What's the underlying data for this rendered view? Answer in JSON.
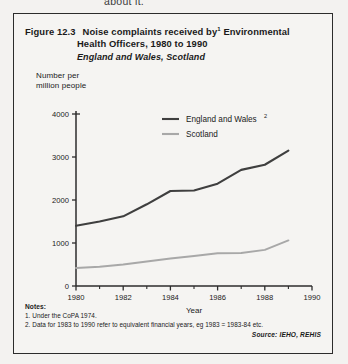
{
  "page_bleed_text": "about it.",
  "figure": {
    "number_label": "Figure 12.3",
    "title_line1": "Noise complaints received by",
    "title_line1_cont": "Environmental",
    "title_superscript": "1",
    "title_line2": "Health Officers, 1980 to 1990",
    "subtitle": "England and Wales, Scotland"
  },
  "notes": {
    "heading": "Notes:",
    "items": [
      "1. Under the CoPA 1974.",
      "2. Data for 1983 to 1990 refer to equivalent financial years, eg 1983 = 1983-84 etc."
    ],
    "source": "Source:  IEHO, REHIS"
  },
  "colors": {
    "england_wales": "#3f3f3f",
    "scotland": "#a8a8a8",
    "axis": "#2c2c2c",
    "box_border": "#2c2c2c",
    "background": "#f3f2f0"
  },
  "chart_data": {
    "type": "line",
    "subtitle": "England and Wales, Scotland",
    "xlabel": "Year",
    "ylabel": "Number per million people",
    "xlim": [
      1980,
      1990
    ],
    "ylim": [
      0,
      4000
    ],
    "xticks": [
      1980,
      1982,
      1984,
      1986,
      1988,
      1990
    ],
    "xtick_labels": [
      "1980",
      "1982",
      "1984",
      "1986",
      "1988",
      "1990"
    ],
    "yticks": [
      0,
      1000,
      2000,
      3000,
      4000
    ],
    "ytick_labels": [
      "0",
      "1000",
      "2000",
      "3000",
      "4000"
    ],
    "grid": false,
    "legend_position": "top-center",
    "x": [
      1980,
      1981,
      1982,
      1983,
      1984,
      1985,
      1986,
      1987,
      1988,
      1989
    ],
    "series": [
      {
        "name": "England and Wales",
        "legend_label": "England and Wales",
        "legend_superscript": "2",
        "color": "#3f3f3f",
        "values": [
          1400,
          1500,
          1620,
          1900,
          2210,
          2220,
          2380,
          2700,
          2820,
          3150
        ]
      },
      {
        "name": "Scotland",
        "legend_label": "Scotland",
        "legend_superscript": "",
        "color": "#a8a8a8",
        "values": [
          420,
          450,
          500,
          570,
          640,
          700,
          760,
          770,
          840,
          1060
        ]
      }
    ]
  }
}
